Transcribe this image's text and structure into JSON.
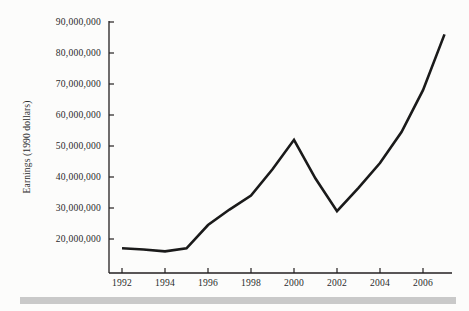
{
  "chart_data": {
    "type": "line",
    "title": "",
    "xlabel": "",
    "ylabel": "Earnings (1990 dollars)",
    "xlim": [
      1992,
      2007
    ],
    "ylim": [
      13000000,
      92000000
    ],
    "grid": false,
    "legend": null,
    "x_tick_labels": [
      "1992",
      "1994",
      "1996",
      "1998",
      "2000",
      "2002",
      "2004",
      "2006"
    ],
    "x_ticks": [
      1992,
      1994,
      1996,
      1998,
      2000,
      2002,
      2004,
      2006
    ],
    "y_tick_labels": [
      "20,000,000",
      "30,000,000",
      "40,000,000",
      "50,000,000",
      "60,000,000",
      "70,000,000",
      "80,000,000",
      "90,000,000"
    ],
    "y_ticks": [
      20000000,
      30000000,
      40000000,
      50000000,
      60000000,
      70000000,
      80000000,
      90000000
    ],
    "x": [
      1992,
      1993,
      1994,
      1995,
      1996,
      1997,
      1998,
      1999,
      2000,
      2001,
      2002,
      2003,
      2004,
      2005,
      2006,
      2007
    ],
    "values": [
      17000000,
      16600000,
      16000000,
      17000000,
      24500000,
      29500000,
      34000000,
      42500000,
      52000000,
      39500000,
      29000000,
      36500000,
      44500000,
      54500000,
      68000000,
      86000000
    ],
    "series": [
      {
        "name": "Earnings",
        "values": [
          17000000,
          16600000,
          16000000,
          17000000,
          24500000,
          29500000,
          34000000,
          42500000,
          52000000,
          39500000,
          29000000,
          36500000,
          44500000,
          54500000,
          68000000,
          86000000
        ]
      }
    ],
    "colors": {
      "line": "#1a1a1a",
      "axis": "#231f20",
      "background": "#fcfcfb",
      "bottom_rule": "#c9c9c9"
    }
  }
}
